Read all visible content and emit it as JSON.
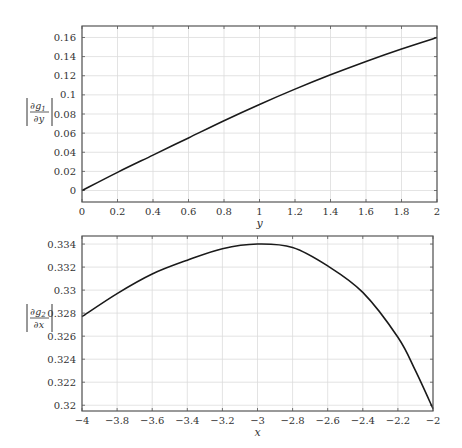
{
  "chart_data": [
    {
      "type": "line",
      "title": "",
      "xlabel": "y",
      "ylabel": "|∂g1/∂y|",
      "ylabel_parts": {
        "numerator": "∂g",
        "subscript": "1",
        "denominator": "∂y"
      },
      "xlim": [
        0,
        2
      ],
      "ylim": [
        -0.012,
        0.172
      ],
      "grid": true,
      "legend": null,
      "x_ticks": [
        "0",
        "0.2",
        "0.4",
        "0.6",
        "0.8",
        "1",
        "1.2",
        "1.4",
        "1.6",
        "1.8",
        "2"
      ],
      "y_ticks": [
        "0",
        "0.02",
        "0.04",
        "0.06",
        "0.08",
        "0.1",
        "0.12",
        "0.14",
        "0.16"
      ],
      "x_tick_values": [
        0,
        0.2,
        0.4,
        0.6,
        0.8,
        1,
        1.2,
        1.4,
        1.6,
        1.8,
        2
      ],
      "y_tick_values": [
        0,
        0.02,
        0.04,
        0.06,
        0.08,
        0.1,
        0.12,
        0.14,
        0.16
      ],
      "series": [
        {
          "name": "|∂g1/∂y|",
          "x": [
            0,
            0.2,
            0.4,
            0.6,
            0.8,
            1.0,
            1.2,
            1.4,
            1.6,
            1.8,
            2.0
          ],
          "values": [
            0.0,
            0.019,
            0.037,
            0.055,
            0.073,
            0.09,
            0.106,
            0.121,
            0.135,
            0.148,
            0.16
          ]
        }
      ]
    },
    {
      "type": "line",
      "title": "",
      "xlabel": "x",
      "ylabel": "|∂g2/∂x|",
      "ylabel_parts": {
        "numerator": "∂g",
        "subscript": "2",
        "denominator": "∂x"
      },
      "xlim": [
        -4,
        -2
      ],
      "ylim": [
        0.3195,
        0.3347
      ],
      "grid": true,
      "legend": null,
      "x_ticks": [
        "−4",
        "−3.8",
        "−3.6",
        "−3.4",
        "−3.2",
        "−3",
        "−2.8",
        "−2.6",
        "−2.4",
        "−2.2",
        "−2"
      ],
      "y_ticks": [
        "0.32",
        "0.322",
        "0.324",
        "0.326",
        "0.328",
        "0.33",
        "0.332",
        "0.334"
      ],
      "x_tick_values": [
        -4,
        -3.8,
        -3.6,
        -3.4,
        -3.2,
        -3,
        -2.8,
        -2.6,
        -2.4,
        -2.2,
        -2
      ],
      "y_tick_values": [
        0.32,
        0.322,
        0.324,
        0.326,
        0.328,
        0.33,
        0.332,
        0.334
      ],
      "series": [
        {
          "name": "|∂g2/∂x|",
          "x": [
            -4.0,
            -3.8,
            -3.6,
            -3.4,
            -3.2,
            -3.0,
            -2.8,
            -2.6,
            -2.4,
            -2.2,
            -2.1,
            -2.0
          ],
          "values": [
            0.3277,
            0.3297,
            0.3314,
            0.3326,
            0.3336,
            0.334,
            0.3337,
            0.3321,
            0.3298,
            0.3259,
            0.323,
            0.3197
          ]
        }
      ]
    }
  ]
}
